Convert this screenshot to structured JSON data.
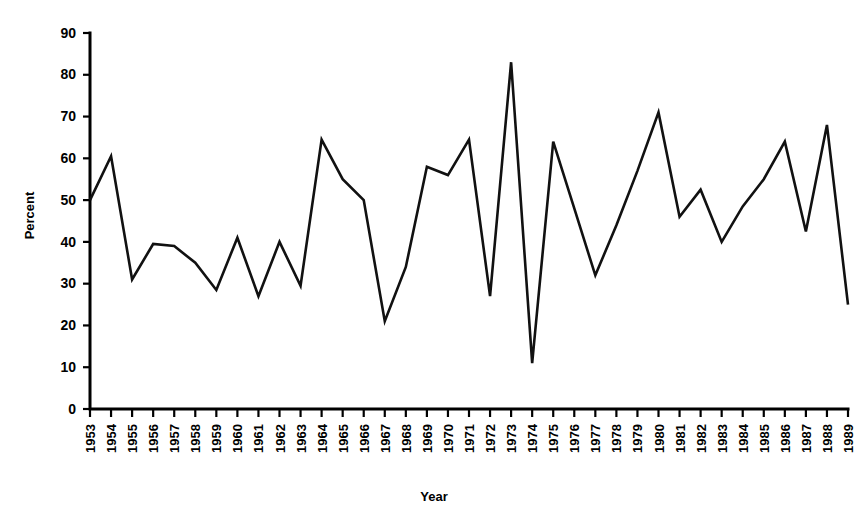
{
  "chart_data": {
    "type": "line",
    "title": "",
    "subtitle": "",
    "xlabel": "Year",
    "ylabel": "Percent",
    "grid": false,
    "legend": false,
    "legend_position": "none",
    "xlim": [
      1953,
      1989
    ],
    "ylim": [
      0,
      90
    ],
    "y_ticks": [
      0,
      10,
      20,
      30,
      40,
      50,
      60,
      70,
      80,
      90
    ],
    "y_tick_labels": [
      "0",
      "10",
      "20",
      "30",
      "40",
      "50",
      "60",
      "70",
      "80",
      "90"
    ],
    "x_tick_rotation": -90,
    "categories": [
      "1953",
      "1954",
      "1955",
      "1956",
      "1957",
      "1958",
      "1959",
      "1960",
      "1961",
      "1962",
      "1963",
      "1964",
      "1965",
      "1966",
      "1967",
      "1968",
      "1969",
      "1970",
      "1971",
      "1972",
      "1973",
      "1974",
      "1975",
      "1976",
      "1977",
      "1978",
      "1979",
      "1980",
      "1981",
      "1982",
      "1983",
      "1984",
      "1985",
      "1986",
      "1987",
      "1988",
      "1989"
    ],
    "series": [
      {
        "name": "Percent",
        "color": "#111111",
        "values": [
          50,
          60.5,
          31,
          39.5,
          39,
          35,
          28.5,
          41,
          27,
          40,
          29.5,
          64.5,
          55,
          50,
          21,
          34,
          58,
          56,
          64.5,
          27,
          83,
          11,
          64,
          48,
          32,
          44,
          57,
          71,
          46,
          52.5,
          40,
          48.5,
          55,
          64,
          42.5,
          68,
          25
        ]
      }
    ]
  },
  "axes": {
    "y_title": "Percent",
    "x_title": "Year"
  }
}
